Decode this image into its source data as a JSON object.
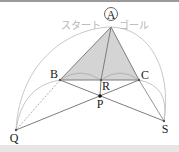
{
  "diagram": {
    "labels": {
      "A": "A",
      "B": "B",
      "C": "C",
      "R": "R",
      "P": "P",
      "Q": "Q",
      "S": "S"
    },
    "start_text": "スタート",
    "goal_text": "ゴール",
    "colors": {
      "triangle_fill": "#d4d4d4",
      "line": "#7d7d7d",
      "arc": "#b8b8b8",
      "text_light": "#b5b5b5",
      "label": "#222222"
    }
  }
}
